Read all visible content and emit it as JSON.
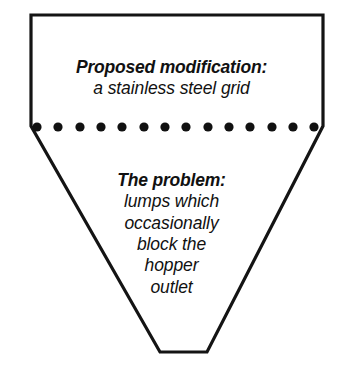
{
  "figure": {
    "name": "hopper-cross-section-diagram",
    "shape": "inverted-trapezoid-hopper",
    "stroke_color": "#141414",
    "fill_color": "#ffffff",
    "stroke_width": 3.2,
    "background_color": "#ffffff",
    "outline_points": "31,15 323,15 323,126 207,352 160,352 31,126",
    "grid": {
      "name": "stainless-steel-grid",
      "dot_count": 14,
      "dot_color": "#111111",
      "dot_radius": 4.6,
      "first_dot_cx": 37,
      "last_dot_cx": 314,
      "dot_cy": 127
    }
  },
  "modification": {
    "heading": "Proposed modification:",
    "line1": "a stainless steel grid"
  },
  "problem": {
    "heading": "The problem:",
    "line1": "lumps which",
    "line2": "occasionally",
    "line3": "block the",
    "line4": "hopper",
    "line5": "outlet"
  }
}
